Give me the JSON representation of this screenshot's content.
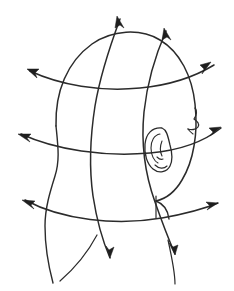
{
  "figure": {
    "title": "Head with directional field lines",
    "background_color": "#ffffff",
    "stroke_color": "#2b2b2b",
    "arrow_color": "#1e1e1e",
    "canvas": {
      "width": 234,
      "height": 291
    },
    "parts": {
      "head_outline": "head-silhouette",
      "ear": "ear",
      "nose": "nose-profile",
      "chin_mark": "chin-tick",
      "neck_left": "neck-left-contour",
      "neck_right": "neck-right-contour"
    },
    "curves": {
      "meridians": [
        {
          "name": "meridian-left",
          "label": "vertical grid line 1"
        },
        {
          "name": "meridian-right",
          "label": "vertical grid line 2"
        }
      ],
      "parallels": [
        {
          "name": "parallel-upper",
          "label": "horizontal grid line 1"
        },
        {
          "name": "parallel-middle",
          "label": "horizontal grid line 2"
        },
        {
          "name": "parallel-lower",
          "label": "horizontal grid line 3"
        }
      ]
    },
    "arrows": [
      {
        "name": "arrow-top-left",
        "direction": "up-right",
        "x": 117,
        "y": 16
      },
      {
        "name": "arrow-top-right",
        "direction": "up-right",
        "x": 164,
        "y": 28
      },
      {
        "name": "arrow-upper-left",
        "direction": "up-left",
        "x": 27,
        "y": 69
      },
      {
        "name": "arrow-upper-right",
        "direction": "up-right",
        "x": 211,
        "y": 62
      },
      {
        "name": "arrow-mid-left",
        "direction": "left",
        "x": 18,
        "y": 135
      },
      {
        "name": "arrow-mid-right",
        "direction": "right",
        "x": 219,
        "y": 126
      },
      {
        "name": "arrow-low-left",
        "direction": "left",
        "x": 22,
        "y": 200
      },
      {
        "name": "arrow-low-right",
        "direction": "right",
        "x": 216,
        "y": 202
      },
      {
        "name": "arrow-bottom-left",
        "direction": "down-right",
        "x": 110,
        "y": 255
      },
      {
        "name": "arrow-bottom-right",
        "direction": "down-right",
        "x": 173,
        "y": 252
      }
    ]
  }
}
